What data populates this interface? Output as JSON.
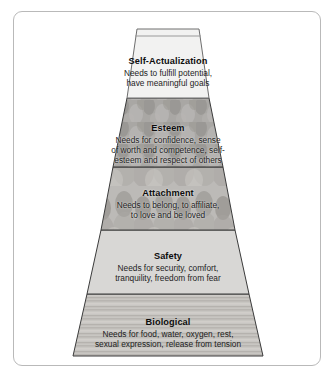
{
  "figure": {
    "name": "maslow-hierarchy-of-needs-pyramid",
    "shape": "flat-topped pyramid with five horizontal tiers",
    "frame_color": "#b9b9b9",
    "background_color": "#ffffff"
  },
  "tiers": [
    {
      "id": "self-actualization",
      "title": "Self-Actualization",
      "lines": [
        "Needs to fulfill potential,",
        "have meaningful goals"
      ],
      "fill": "#f2f2f1",
      "texture": "plain light",
      "order": 1
    },
    {
      "id": "esteem",
      "title": "Esteem",
      "lines": [
        "Needs for confidence, sense",
        "of worth and competence, self-",
        "esteem and respect of others"
      ],
      "fill": "#a9a7a4",
      "texture": "mottled grayscale photograph",
      "order": 2
    },
    {
      "id": "attachment",
      "title": "Attachment",
      "lines": [
        "Needs to belong, to affiliate,",
        "to love and be loved"
      ],
      "fill": "#b4b2b0",
      "texture": "grayscale photograph of a group of people",
      "order": 3
    },
    {
      "id": "safety",
      "title": "Safety",
      "lines": [
        "Needs for security, comfort,",
        "tranquility, freedom from fear"
      ],
      "fill": "#d8d7d5",
      "texture": "plain medium gray",
      "order": 4
    },
    {
      "id": "biological",
      "title": "Biological",
      "lines": [
        "Needs for food, water, oxygen, rest,",
        "sexual expression, release from tension"
      ],
      "fill": "#c6c4c0",
      "texture": "horizontal wood-grain striping",
      "order": 5
    }
  ]
}
